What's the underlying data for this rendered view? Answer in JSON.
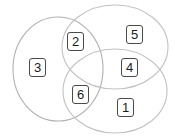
{
  "figure": {
    "name": "three-set-venn-diagram",
    "background_color": "#ffffff",
    "outline_color": "#b0b0b0",
    "label_border_color": "#4a4a4a",
    "label_text_color": "#1a1a1a",
    "width": 175,
    "height": 139
  },
  "sets": [
    {
      "id": "left",
      "shape": "circle",
      "cx": 58,
      "cy": 69,
      "rx": 45,
      "ry": 52,
      "rotation": 0
    },
    {
      "id": "top-right",
      "shape": "ellipse",
      "cx": 115,
      "cy": 47,
      "rx": 53,
      "ry": 42,
      "rotation": 0
    },
    {
      "id": "bottom-right",
      "shape": "ellipse",
      "cx": 115,
      "cy": 91,
      "rx": 52,
      "ry": 42,
      "rotation": 0
    }
  ],
  "regions": [
    {
      "id": "left-only",
      "label": "3",
      "x": 29,
      "y": 58,
      "sets": [
        "left"
      ]
    },
    {
      "id": "left-and-top",
      "label": "2",
      "x": 67,
      "y": 32,
      "sets": [
        "left",
        "top-right"
      ]
    },
    {
      "id": "top-only",
      "label": "5",
      "x": 126,
      "y": 25,
      "sets": [
        "top-right"
      ]
    },
    {
      "id": "top-and-bottom",
      "label": "4",
      "x": 121,
      "y": 58,
      "sets": [
        "top-right",
        "bottom-right"
      ]
    },
    {
      "id": "left-and-bottom",
      "label": "6",
      "x": 72,
      "y": 85,
      "sets": [
        "left",
        "bottom-right"
      ]
    },
    {
      "id": "bottom-only",
      "label": "1",
      "x": 117,
      "y": 98,
      "sets": [
        "bottom-right"
      ]
    }
  ]
}
